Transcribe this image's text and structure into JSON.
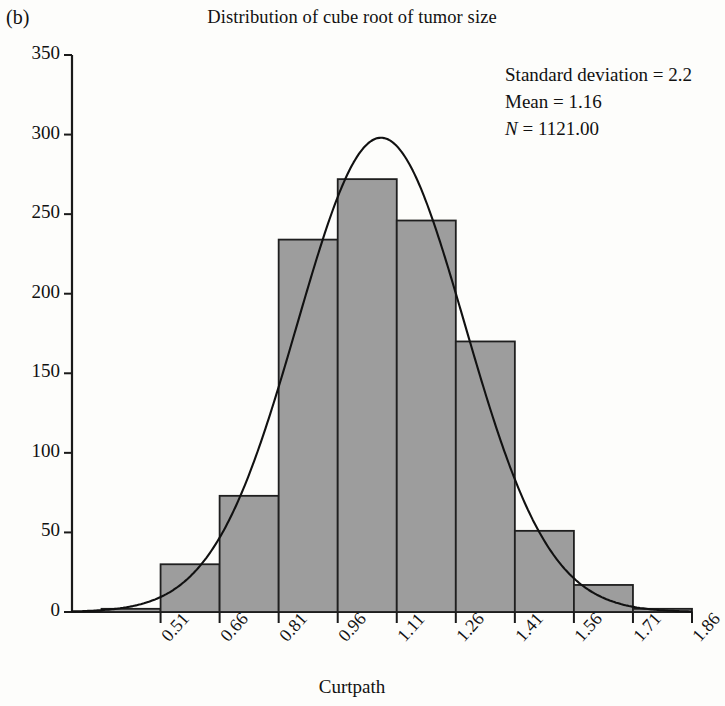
{
  "figure": {
    "panel_label": "(b)",
    "title": "Distribution of cube root of tumor size"
  },
  "stats": {
    "std_label": "Standard deviation = 2.2",
    "mean_label": "Mean = 1.16",
    "n_symbol": "N",
    "n_value": " = 1121.00"
  },
  "axes": {
    "x_title": "Curtpath",
    "y_title": ""
  },
  "chart_data": {
    "type": "bar",
    "title": "Distribution of cube root of tumor size",
    "xlabel": "Curtpath",
    "ylabel": "",
    "categories": [
      "0.51",
      "0.66",
      "0.81",
      "0.96",
      "1.11",
      "1.26",
      "1.41",
      "1.56",
      "1.71",
      "1.86"
    ],
    "tick_labels": [
      "0.51",
      "0.66",
      "0.81",
      "0.96",
      "1.11",
      "1.26",
      "1.41",
      "1.56",
      "1.71",
      "1.86"
    ],
    "values": [
      2,
      30,
      73,
      234,
      272,
      246,
      170,
      51,
      17,
      2
    ],
    "bin_width": 0.15,
    "bin_left_edges": [
      0.435,
      0.585,
      0.735,
      0.885,
      1.035,
      1.185,
      1.335,
      1.485,
      1.635,
      1.785
    ],
    "yticks": [
      0,
      50,
      100,
      150,
      200,
      250,
      300,
      350
    ],
    "ylim": [
      0,
      350
    ],
    "xlim": [
      0.36,
      1.935
    ],
    "grid": false,
    "legend": null,
    "bar_fill": "#9d9d9d",
    "bar_edge": "#1f1f1f",
    "overlay": {
      "name": "normal curve",
      "type": "line",
      "mean": 1.145,
      "sigma": 0.213,
      "peak": 298,
      "color": "#111111"
    },
    "annotations": [
      "Standard deviation = 2.2",
      "Mean = 1.16",
      "N = 1121.00"
    ]
  }
}
